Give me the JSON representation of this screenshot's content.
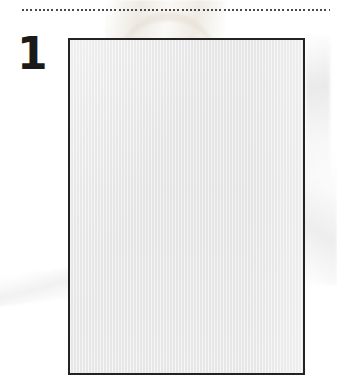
{
  "page": {
    "number_label": "1",
    "background_color": "#ffffff",
    "width": 337,
    "height": 378
  },
  "rule": {
    "name": "dotted-horizontal-rule",
    "style": "dotted",
    "color": "#4a4a4a",
    "start_x": 22,
    "end_x": 330,
    "y": 9
  },
  "figure": {
    "caption": "",
    "content_text": "",
    "border_color": "#232323",
    "border_width": 2,
    "fill_color": "#e9e9e9",
    "x": 68,
    "y": 38,
    "width": 237,
    "height": 337
  },
  "watermarks": {
    "top_center_color": "#e9e4da",
    "right_edge_color": "#e6e6e6",
    "left_diagonal_color": "#f0f0f0"
  }
}
